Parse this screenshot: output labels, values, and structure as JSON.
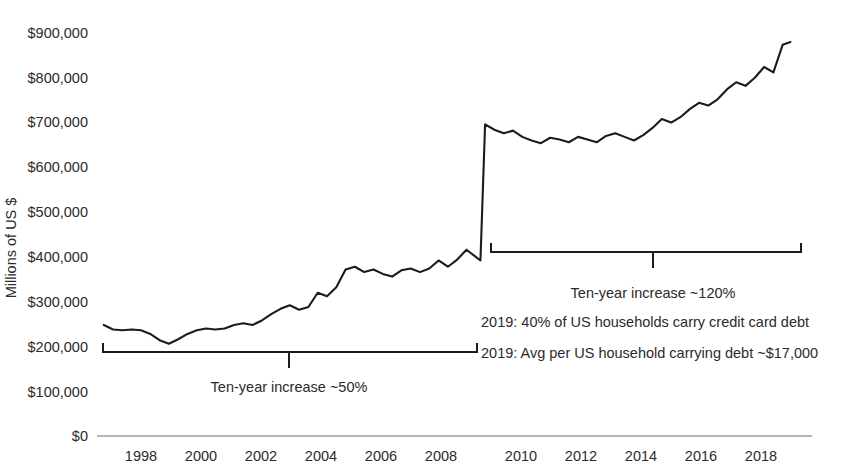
{
  "chart_data": {
    "type": "line",
    "title": "",
    "xlabel": "",
    "ylabel": "Millions of US $",
    "ylim": [
      0,
      900000
    ],
    "xlim": [
      1996.8,
      2019.0
    ],
    "grid": false,
    "legend": null,
    "y_ticks": [
      0,
      100000,
      200000,
      300000,
      400000,
      500000,
      600000,
      700000,
      800000,
      900000
    ],
    "y_tick_labels": [
      "$0",
      "$100,000",
      "$200,000",
      "$300,000",
      "$400,000",
      "$500,000",
      "$600,000",
      "$700,000",
      "$800,000",
      "$900,000"
    ],
    "x_ticks": [
      1998,
      2000,
      2002,
      2004,
      2006,
      2008,
      2010,
      2012,
      2014,
      2016,
      2018
    ],
    "x_tick_labels": [
      "1998",
      "2000",
      "2002",
      "2004",
      "2006",
      "2008",
      "2010",
      "2012",
      "2014",
      "2016",
      "2018"
    ],
    "series": [
      {
        "name": "US credit card debt",
        "color": "#1c1c1c",
        "x": [
          1996.8,
          1997.1,
          1997.4,
          1997.7,
          1998.0,
          1998.3,
          1998.6,
          1998.9,
          1999.2,
          1999.5,
          1999.8,
          2000.1,
          2000.4,
          2000.7,
          2001.0,
          2001.3,
          2001.6,
          2001.9,
          2002.2,
          2002.5,
          2002.8,
          2003.1,
          2003.4,
          2003.7,
          2004.0,
          2004.3,
          2004.6,
          2004.9,
          2005.2,
          2005.5,
          2005.8,
          2006.1,
          2006.4,
          2006.7,
          2007.0,
          2007.3,
          2007.6,
          2007.9,
          2008.2,
          2008.5,
          2008.8,
          2008.95,
          2009.1,
          2009.4,
          2009.7,
          2010.0,
          2010.3,
          2010.6,
          2010.9,
          2011.2,
          2011.5,
          2011.8,
          2012.1,
          2012.4,
          2012.7,
          2013.0,
          2013.3,
          2013.6,
          2013.9,
          2014.2,
          2014.5,
          2014.8,
          2015.1,
          2015.4,
          2015.7,
          2016.0,
          2016.3,
          2016.6,
          2016.9,
          2017.2,
          2017.5,
          2017.8,
          2018.1,
          2018.4,
          2018.7,
          2018.95
        ],
        "y": [
          248000,
          238000,
          236000,
          238000,
          236000,
          228000,
          214000,
          206000,
          216000,
          228000,
          236000,
          240000,
          238000,
          240000,
          248000,
          252000,
          248000,
          258000,
          272000,
          284000,
          292000,
          282000,
          288000,
          320000,
          312000,
          332000,
          372000,
          378000,
          366000,
          372000,
          362000,
          356000,
          370000,
          374000,
          366000,
          374000,
          392000,
          378000,
          394000,
          416000,
          400000,
          392000,
          696000,
          684000,
          676000,
          682000,
          668000,
          660000,
          654000,
          666000,
          662000,
          656000,
          668000,
          662000,
          656000,
          670000,
          676000,
          668000,
          660000,
          672000,
          688000,
          708000,
          700000,
          712000,
          730000,
          744000,
          738000,
          752000,
          774000,
          790000,
          782000,
          800000,
          824000,
          812000,
          874000,
          880000
        ]
      }
    ],
    "annotations": [
      {
        "id": "left-bracket-label",
        "text": "Ten-year increase ~50%",
        "x_range": [
          1997.0,
          2008.2
        ],
        "y_position": 200000
      },
      {
        "id": "right-bracket-label",
        "text": "Ten-year increase ~120%",
        "x_range": [
          2009.0,
          2019.0
        ],
        "y_position": 400000
      },
      {
        "id": "households-stat",
        "text": "2019: 40% of US households carry credit card debt"
      },
      {
        "id": "avg-debt-stat",
        "text": "2019: Avg per US household carrying debt ~$17,000"
      }
    ]
  },
  "axis": {
    "y_title": "Millions of US $"
  },
  "colors": {
    "line": "#1c1c1c",
    "text": "#2b2b2b",
    "axis": "#6f6f6f",
    "background": "#ffffff"
  }
}
